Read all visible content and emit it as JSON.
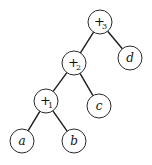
{
  "diagram": {
    "type": "binary-expression-tree",
    "nodes": [
      {
        "id": "plus3",
        "label": "+",
        "subscript": "3",
        "x": 100,
        "y": 22,
        "kind": "operator"
      },
      {
        "id": "plus2",
        "label": "+",
        "subscript": "2",
        "x": 74,
        "y": 63,
        "kind": "operator"
      },
      {
        "id": "d",
        "label": "d",
        "subscript": "",
        "x": 130,
        "y": 58,
        "kind": "leaf"
      },
      {
        "id": "plus1",
        "label": "+",
        "subscript": "1",
        "x": 46,
        "y": 101,
        "kind": "operator"
      },
      {
        "id": "c",
        "label": "c",
        "subscript": "",
        "x": 99,
        "y": 106,
        "kind": "leaf"
      },
      {
        "id": "a",
        "label": "a",
        "subscript": "",
        "x": 22,
        "y": 141,
        "kind": "leaf"
      },
      {
        "id": "b",
        "label": "b",
        "subscript": "",
        "x": 74,
        "y": 141,
        "kind": "leaf"
      }
    ],
    "edges": [
      {
        "from": "plus3",
        "to": "plus2"
      },
      {
        "from": "plus3",
        "to": "d"
      },
      {
        "from": "plus2",
        "to": "plus1"
      },
      {
        "from": "plus2",
        "to": "c"
      },
      {
        "from": "plus1",
        "to": "a"
      },
      {
        "from": "plus1",
        "to": "b"
      }
    ]
  }
}
